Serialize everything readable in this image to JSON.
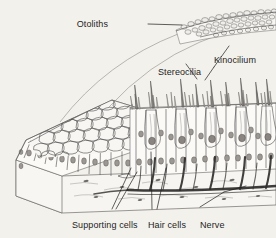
{
  "figure": {
    "background_color": "#f3f1ec",
    "ink_color": "#4a4a4a",
    "label_color": "#1d1d1d"
  },
  "labels": {
    "otoliths": "Otoliths",
    "stereocilia": "Stereocilia",
    "kinocilium": "Kinocilium",
    "supporting_cells": "Supporting cells",
    "hair_cells": "Hair cells",
    "nerve": "Nerve"
  },
  "structures": {
    "otolith_mass": "granular crystal layer at upper right",
    "gelatinous_membrane": "two long curved outlines sweeping down-left from otolith mass",
    "apical_surface": "polygonal honeycomb mosaic of cell apices on left block",
    "epithelium": "columnar supporting cells alternating with flask-shaped hair cells",
    "connective_tissue": "stippled basal layer beneath epithelium",
    "nerve_trunk": "dark horizontal fiber bundle with ascending branches"
  }
}
